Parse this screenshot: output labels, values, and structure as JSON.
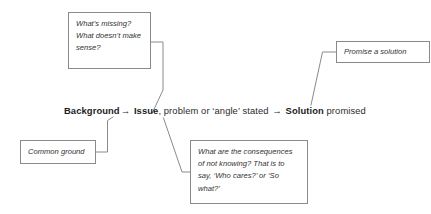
{
  "diagram": {
    "line_color": "#8a8a8a",
    "text_color": "#333333",
    "bold_text_color": "#1c1c1c",
    "background": "#ffffff"
  },
  "main_sentence": {
    "background_label": "Background",
    "arrow_1": "→",
    "issue_label": "Issue",
    "middle_text": ", problem or ‘angle’ stated ",
    "arrow_2": "→",
    "solution_label": "Solution",
    "trailing_text": " promised"
  },
  "callouts": {
    "missing": "What’s missing?\nWhat doesn’t make\nsense?",
    "promise": "Promise a solution",
    "common_ground": "Common ground",
    "consequences": "What are the consequences\nof not knowing? That is to\nsay, ‘Who cares?’ or ‘So\nwhat?’"
  }
}
